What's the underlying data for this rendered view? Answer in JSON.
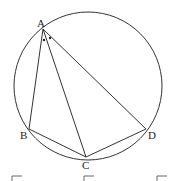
{
  "diagram": {
    "type": "inscribed-quadrilateral",
    "circle": {
      "cx": 88,
      "cy": 86,
      "r": 74
    },
    "points": {
      "A": {
        "label": "A",
        "x": 43,
        "y": 29
      },
      "B": {
        "label": "B",
        "x": 29,
        "y": 129
      },
      "C": {
        "label": "C",
        "x": 86,
        "y": 157
      },
      "D": {
        "label": "D",
        "x": 146,
        "y": 129
      }
    },
    "segments": [
      "AB",
      "AC",
      "AD",
      "BC",
      "CD"
    ],
    "angle_marks": "two dots at A marking angle BAC = angle CAD",
    "colors": {
      "stroke": "#333333",
      "text": "#222222"
    }
  }
}
